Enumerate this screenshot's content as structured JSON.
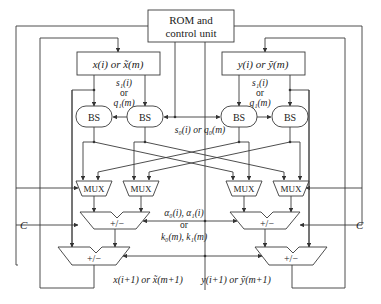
{
  "diagram": {
    "rom": {
      "line1": "ROM and",
      "line2": "control unit"
    },
    "x_reg": "x(i) or x̃(m)",
    "y_reg": "y(i) or ỹ(m)",
    "left_coef": {
      "l1": "s₁(i)",
      "l2": "or",
      "l3": "q₁(m)"
    },
    "right_coef": {
      "l1": "s₁(i)",
      "l2": "or",
      "l3": "q₁(m)"
    },
    "center_coef": "s₀(i) or q₀(m)",
    "bs_label": "BS",
    "mux_label": "MUX",
    "addsub_label": "+/−",
    "alpha": {
      "l1": "α₀(i), α₁(i)",
      "l2": "or",
      "l3": "k₀(m), k₁(m)"
    },
    "c_left": "C",
    "c_right": "C",
    "x_out": "x(i+1) or x̃(m+1)",
    "y_out": "y(i+1) or ỹ(m+1)"
  }
}
